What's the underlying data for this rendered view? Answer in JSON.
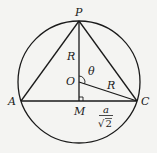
{
  "diagram": {
    "points": {
      "P": "P",
      "A": "A",
      "C": "C",
      "M": "M",
      "O": "O"
    },
    "labels": {
      "radius_PO": "R",
      "radius_OC": "R",
      "angle": "θ",
      "half_base_numerator": "a",
      "half_base_denominator_symbol": "√",
      "half_base_denominator_value": "2"
    },
    "colors": {
      "stroke": "#1a1a1a",
      "background": "#f4f4f2"
    }
  }
}
